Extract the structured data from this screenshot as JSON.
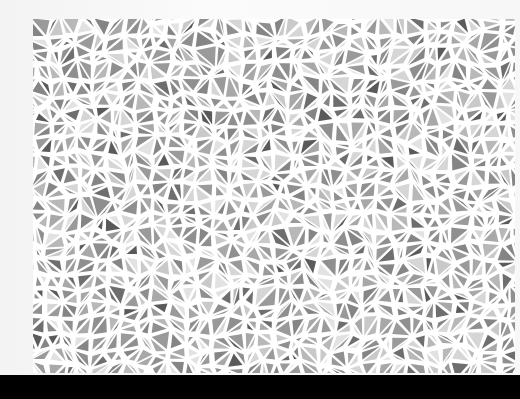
{
  "image": {
    "subject": "grayscale triangle mosaic print",
    "background_color": "#f7f7f7",
    "gap_color": "#ffffff",
    "bottom_band_color": "#000000"
  },
  "mosaic": {
    "x": 33,
    "y": 19,
    "width": 482,
    "height": 354,
    "cell_size": 15,
    "gap": 2.2,
    "seed": 20240611,
    "palette": [
      "#5a5a5a",
      "#6e6e6e",
      "#858585",
      "#8f8f8f",
      "#9a9a9a",
      "#a8a8a8",
      "#b8b8b8",
      "#c9c9c9",
      "#d6d6d6",
      "#e2e2e2"
    ],
    "palette_weights": [
      1,
      2,
      4,
      5,
      5,
      4,
      3,
      3,
      3,
      2
    ]
  }
}
